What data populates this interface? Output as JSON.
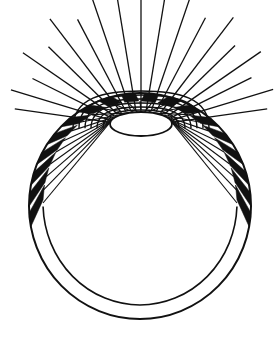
{
  "figure": {
    "title": "Parachute canopy line drawing",
    "background_color": "#ffffff",
    "ink_color": "#111111",
    "canvas": {
      "width": 278,
      "height": 340
    }
  },
  "geometry": {
    "hub": {
      "name": "central-ellipse",
      "cx": 141,
      "cy": 124,
      "rx": 31,
      "ry": 12,
      "stroke_width": 1.8,
      "fill": "#ffffff"
    },
    "outer_circle": {
      "name": "outer-rim-circle",
      "cx": 140,
      "cy": 206,
      "rx": 111,
      "ry": 113,
      "stroke_width": 2.0,
      "top_y": 93,
      "bottom_y": 319,
      "left_x": 29,
      "right_x": 251
    },
    "inner_arc": {
      "name": "inner-rim-arc",
      "cx": 140,
      "cy": 203,
      "rx": 97,
      "ry": 102,
      "stroke_width": 1.6,
      "bottom_y": 305
    },
    "crest_arcs": {
      "name": "nested-crest-arcs",
      "count": 6,
      "stroke_width": 1.4,
      "peak_y_values": [
        91,
        95,
        99,
        103,
        107,
        110
      ],
      "half_width_values": [
        68,
        62,
        56,
        50,
        44,
        38
      ]
    },
    "suspension_lines": {
      "name": "suspension-lines",
      "count": 25,
      "stroke_width": 1.1,
      "start_angle_deg": 190,
      "end_angle_deg": 350,
      "note": "Thin radial cords running from the hub ellipse rim out to the inner canopy arc."
    },
    "rays": {
      "name": "upper-radiating-rays",
      "count": 19,
      "stroke_width": 1.3,
      "inner_offset": 2,
      "lengths": [
        118,
        126,
        112,
        134,
        120,
        142,
        128,
        150,
        138,
        155,
        140,
        150,
        130,
        144,
        122,
        136,
        114,
        128,
        118
      ],
      "note": "Straight rays fanning upward and outward from the hub, extending past the crest arcs to the image margins."
    },
    "ribs": {
      "name": "canopy-rib-segments",
      "count": 18,
      "fill": "#111111",
      "note": "Thick black quadrilateral panels bridging the inner rim arc and the outer rim circle; near-vertical at the bottom, steeply slanted along the sides."
    }
  },
  "elements": {
    "hub_label": "central ellipse hub",
    "outer_rim_label": "outer rim circle",
    "inner_rim_label": "inner canopy rim",
    "ribs_label": "rib segments",
    "lines_label": "suspension lines",
    "rays_label": "radiating rays",
    "crest_label": "crest arcs"
  }
}
